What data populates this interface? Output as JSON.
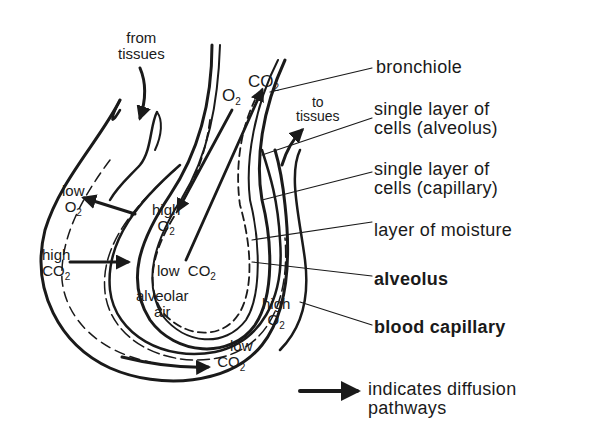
{
  "labels": {
    "bronchiole": "bronchiole",
    "alveolus_cells_1": "single layer of",
    "alveolus_cells_2": "cells (alveolus)",
    "capillary_cells_1": "single layer of",
    "capillary_cells_2": "cells (capillary)",
    "moisture": "layer of moisture",
    "alveolus": "alveolus",
    "blood_capillary": "blood capillary"
  },
  "legend": {
    "line1": "indicates diffusion",
    "line2": "pathways"
  },
  "annotations": {
    "from_tissues_1": "from",
    "from_tissues_2": "tissues",
    "to_tissues_1": "to",
    "to_tissues_2": "tissues",
    "o2": "O",
    "co2": "CO",
    "sub2": "2",
    "low": "low",
    "high": "high",
    "alveolar_1": "alveolar",
    "alveolar_2": "air"
  },
  "colors": {
    "ink": "#1a1a1a",
    "background": "#ffffff"
  }
}
